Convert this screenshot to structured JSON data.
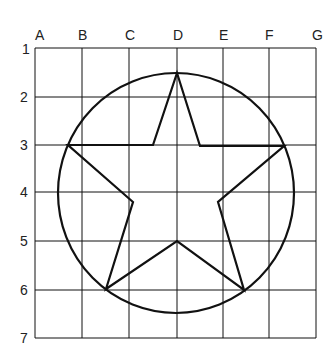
{
  "diagram": {
    "columns": [
      "A",
      "B",
      "C",
      "D",
      "E",
      "F",
      "G"
    ],
    "rows": [
      "1",
      "2",
      "3",
      "4",
      "5",
      "6",
      "7"
    ],
    "grid": {
      "x": [
        35,
        82,
        129,
        177,
        223,
        269,
        316
      ],
      "y": [
        48,
        97,
        145,
        192,
        241,
        290,
        338
      ]
    },
    "circle": {
      "cx": 176,
      "cy": 193,
      "rx": 118,
      "ry": 120
    },
    "star_points": [
      [
        177,
        73
      ],
      [
        200,
        146
      ],
      [
        284,
        146
      ],
      [
        218,
        202
      ],
      [
        244,
        290
      ],
      [
        177,
        241
      ],
      [
        106,
        289
      ],
      [
        133,
        202
      ],
      [
        68,
        145
      ],
      [
        153,
        145
      ]
    ],
    "line_color": "#111111"
  }
}
